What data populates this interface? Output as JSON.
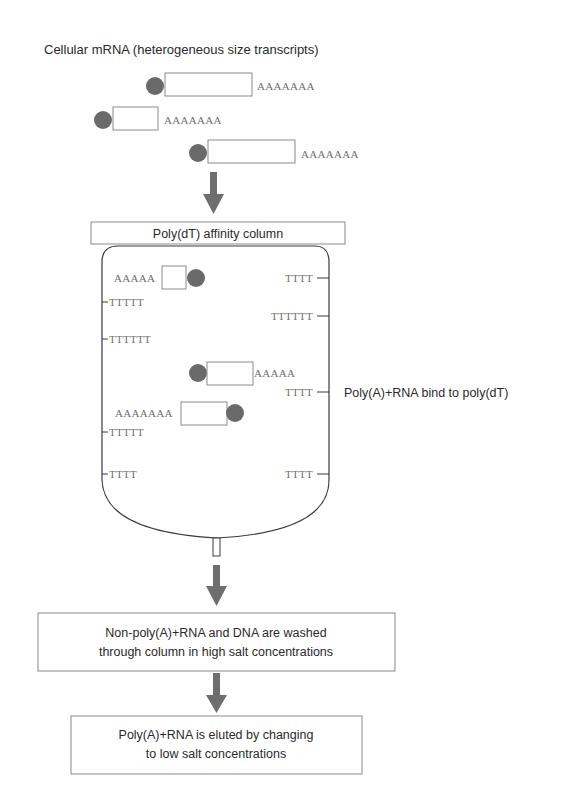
{
  "diagram": {
    "title": "Cellular mRNA (heterogeneous size transcripts)",
    "input_transcripts": [
      {
        "tail": "AAAAAAA"
      },
      {
        "tail": "AAAAAAA"
      },
      {
        "tail": "AAAAAAA"
      }
    ],
    "column": {
      "label": "Poly(dT) affinity column",
      "left_oligos": [
        "TTTTT",
        "TTTTTT",
        "TTTTT",
        "TTTT"
      ],
      "right_oligos": [
        "TTTT",
        "TTTTTT",
        "TTTT",
        "TTTT"
      ],
      "bound_transcripts": [
        {
          "tail": "AAAAA"
        },
        {
          "tail": "AAAAA"
        },
        {
          "tail": "AAAAAAA"
        }
      ],
      "annotation": "Poly(A)+RNA bind to poly(dT)"
    },
    "steps": [
      {
        "line1": "Non-poly(A)+RNA and DNA are washed",
        "line2": "through column in high salt concentrations"
      },
      {
        "line1": "Poly(A)+RNA is eluted by changing",
        "line2": "to low salt concentrations"
      }
    ],
    "colors": {
      "cap": "#6a6a6a",
      "arrow": "#6e6e6e",
      "poly_text": "#6e6e6e",
      "outline": "#3a3a3a"
    }
  }
}
